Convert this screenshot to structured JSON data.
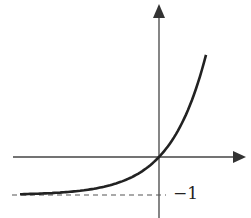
{
  "chart_data": {
    "type": "line",
    "title": "",
    "function": "y = e^x - 1",
    "xlabel": "",
    "ylabel": "",
    "annotations": [
      {
        "text": "−1",
        "position": "right of y-axis at asymptote"
      }
    ],
    "asymptote": {
      "y": -1,
      "style": "dashed"
    },
    "points": [
      [
        -3.5,
        -0.97
      ],
      [
        -2,
        -0.86
      ],
      [
        -1,
        -0.63
      ],
      [
        -0.5,
        -0.39
      ],
      [
        0,
        0
      ],
      [
        0.5,
        0.65
      ],
      [
        1,
        1.72
      ],
      [
        1.3,
        2.67
      ]
    ],
    "grid": false,
    "legend": null
  },
  "labels": {
    "asymptote_value": "−1"
  },
  "colors": {
    "curve": "#222222",
    "axes": "#444444"
  }
}
